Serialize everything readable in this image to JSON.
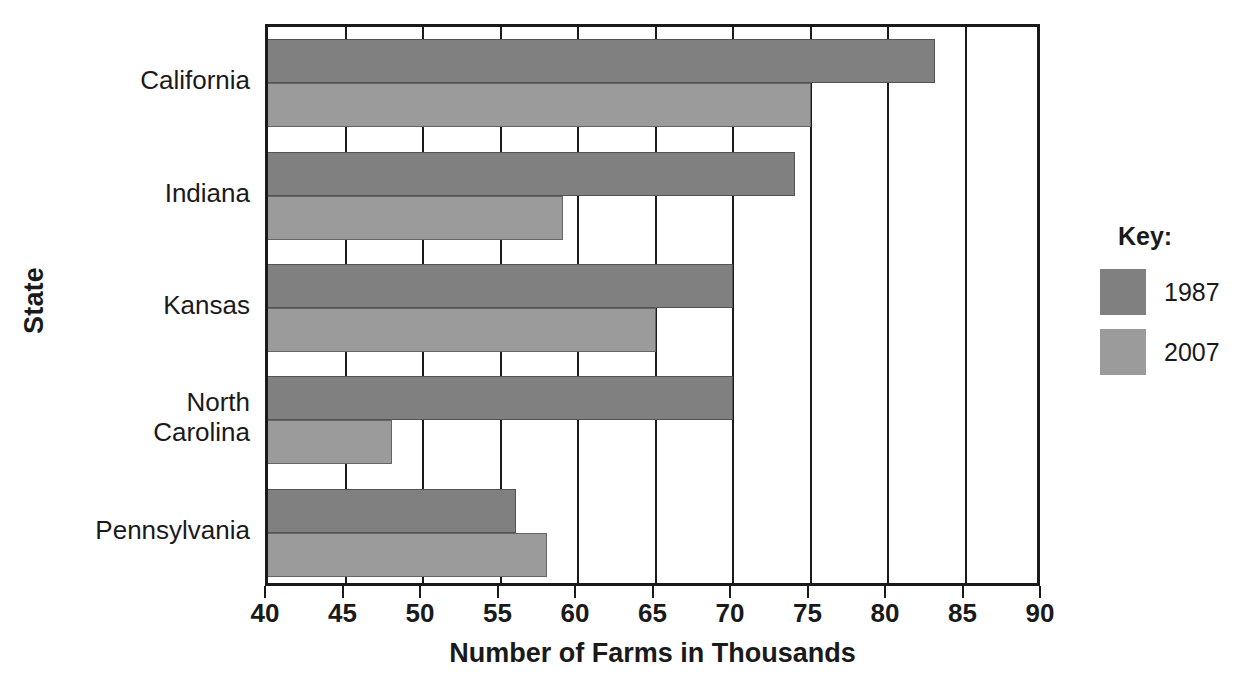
{
  "chart_data": {
    "type": "bar",
    "orientation": "horizontal",
    "title": "",
    "xlabel": "Number of Farms in Thousands",
    "ylabel": "State",
    "categories": [
      "California",
      "Indiana",
      "Kansas",
      "North\nCarolina",
      "Pennsylvania"
    ],
    "series": [
      {
        "name": "1987",
        "color": "#808080",
        "values": [
          83,
          74,
          70,
          70,
          56
        ]
      },
      {
        "name": "2007",
        "color": "#9b9b9b",
        "values": [
          75,
          59,
          65,
          48,
          58
        ]
      }
    ],
    "xlim": [
      40,
      90
    ],
    "xticks": [
      40,
      45,
      50,
      55,
      60,
      65,
      70,
      75,
      80,
      85,
      90
    ],
    "xtick_labels": [
      "40",
      "45",
      "50",
      "55",
      "60",
      "65",
      "70",
      "75",
      "80",
      "85",
      "90"
    ],
    "grid": "vertical",
    "legend_position": "right",
    "legend_title": "Key:"
  },
  "axes": {
    "y_title": "State",
    "x_title": "Number of Farms in Thousands"
  },
  "legend": {
    "title": "Key:",
    "entries": [
      {
        "label": "1987",
        "color": "#808080"
      },
      {
        "label": "2007",
        "color": "#9b9b9b"
      }
    ]
  },
  "colors": {
    "series_1987": "#808080",
    "series_2007": "#9b9b9b",
    "axis": "#1a1a1a",
    "background": "#ffffff"
  }
}
